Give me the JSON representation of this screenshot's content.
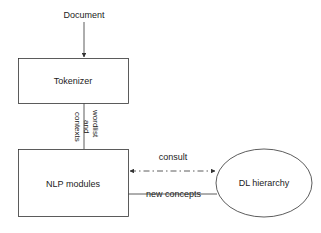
{
  "diagram": {
    "nodes": {
      "document": {
        "label": "Document"
      },
      "tokenizer": {
        "label": "Tokenizer"
      },
      "nlp_modules": {
        "label": "NLP modules"
      },
      "dl_hierarchy": {
        "label": "DL hierarchy"
      }
    },
    "edges": {
      "document_to_tokenizer": {
        "label": ""
      },
      "tokenizer_to_nlp": {
        "label_lines": [
          "wordlist",
          "and",
          "contexts"
        ]
      },
      "consult": {
        "label": "consult",
        "style": "dash-dot",
        "direction": "bidirectional"
      },
      "new_concepts": {
        "label": "new concepts",
        "style": "solid"
      }
    },
    "colors": {
      "stroke": "#333333",
      "text": "#222222",
      "background": "#ffffff"
    }
  }
}
